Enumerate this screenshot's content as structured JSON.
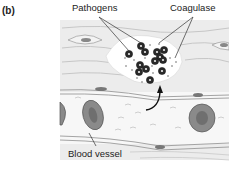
{
  "panel": {
    "label": "(b)"
  },
  "labels": {
    "pathogens": "Pathogens",
    "coagulase": "Coagulase",
    "blood_vessel": "Blood vessel"
  },
  "colors": {
    "tissue_bg": "#e9e9e9",
    "tissue_lines": "#b8b8b8",
    "pathogen": "#2a2a2a",
    "rbc": "#8a8a8a",
    "vessel_lumen": "#f6f6f6"
  }
}
